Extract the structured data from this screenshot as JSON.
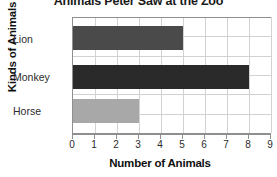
{
  "chart_data": {
    "type": "bar",
    "orientation": "horizontal",
    "title": "Animals Peter Saw at the Zoo",
    "xlabel": "Number of Animals",
    "ylabel": "Kinds of Animals",
    "categories": [
      "Lion",
      "Monkey",
      "Horse"
    ],
    "values": [
      5,
      8,
      3
    ],
    "bar_colors": [
      "#4a4a4a",
      "#2a2a2a",
      "#a8a8a8"
    ],
    "xlim": [
      0,
      9
    ],
    "xticks": [
      0,
      1,
      2,
      3,
      4,
      5,
      6,
      7,
      8,
      9
    ],
    "xtick_labels": [
      "0",
      "1",
      "2",
      "3",
      "4",
      "5",
      "6",
      "7",
      "8",
      "9"
    ],
    "grid": true,
    "legend": false,
    "background_color": "#ffffff",
    "gridline_color": "#d2d2d2",
    "axis_color": "#8f8f8f"
  }
}
